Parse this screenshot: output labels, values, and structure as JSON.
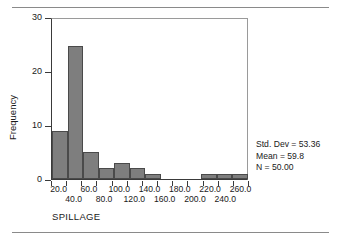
{
  "chart_data": {
    "type": "bar",
    "title": "",
    "xlabel": "SPILLAGE",
    "ylabel": "Frequency",
    "categories": [
      "20.0",
      "40.0",
      "60.0",
      "80.0",
      "100.0",
      "120.0",
      "140.0",
      "160.0",
      "180.0",
      "200.0",
      "220.0",
      "240.0",
      "260.0"
    ],
    "values": [
      9,
      25,
      5,
      2,
      3,
      2,
      1,
      0,
      0,
      0,
      1,
      1,
      1
    ],
    "x": [
      20,
      40,
      60,
      80,
      100,
      120,
      140,
      160,
      180,
      200,
      220,
      240,
      260
    ],
    "bin_width": 20,
    "xlim": [
      10,
      270
    ],
    "ylim": [
      0,
      30
    ],
    "yticks": [
      "0",
      "10",
      "20",
      "30"
    ],
    "ytick_values": [
      0,
      10,
      20,
      30
    ],
    "xticks_row1": [
      "20.0",
      "60.0",
      "100.0",
      "140.0",
      "180.0",
      "220.0",
      "260.0"
    ],
    "xticks_row2": [
      "40.0",
      "80.0",
      "120.0",
      "160.0",
      "200.0",
      "240.0"
    ],
    "grid": false,
    "legend": "none",
    "bar_color": "#7e7e7e",
    "bar_edge_color": "#4a4a4a"
  },
  "annotations": {
    "std_dev": "Std. Dev = 53.36",
    "mean": "Mean = 59.8",
    "n": "N = 50.00"
  },
  "axis": {
    "x_title": "SPILLAGE",
    "y_title": "Frequency"
  }
}
